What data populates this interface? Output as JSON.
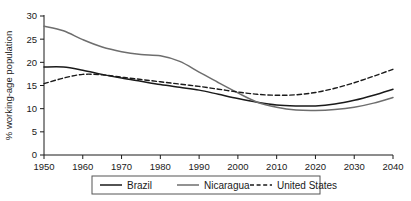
{
  "chart_data": {
    "type": "line",
    "title": "",
    "xlabel": "",
    "ylabel": "% working-age population",
    "xlim": [
      1950,
      2040
    ],
    "ylim": [
      0,
      30
    ],
    "xticks": [
      1950,
      1960,
      1970,
      1980,
      1990,
      2000,
      2010,
      2020,
      2030,
      2040
    ],
    "yticks": [
      0,
      5,
      10,
      15,
      20,
      25,
      30
    ],
    "grid": false,
    "legend_position": "bottom",
    "x": [
      1950,
      1955,
      1960,
      1965,
      1970,
      1975,
      1980,
      1985,
      1990,
      1995,
      2000,
      2005,
      2010,
      2015,
      2020,
      2025,
      2030,
      2035,
      2040
    ],
    "series": [
      {
        "name": "Brazil",
        "style": "solid",
        "color": "#1a1a1a",
        "values": [
          19.0,
          19.0,
          18.3,
          17.4,
          16.6,
          15.9,
          15.2,
          14.6,
          14.0,
          13.1,
          12.2,
          11.4,
          10.8,
          10.6,
          10.6,
          11.0,
          11.8,
          12.9,
          14.2
        ]
      },
      {
        "name": "Nicaragua",
        "style": "solid",
        "color": "#6e6e6e",
        "values": [
          27.8,
          26.8,
          24.9,
          23.3,
          22.3,
          21.7,
          21.4,
          20.2,
          17.9,
          15.6,
          13.4,
          11.4,
          10.3,
          9.7,
          9.6,
          9.8,
          10.3,
          11.2,
          12.4
        ]
      },
      {
        "name": "United States",
        "style": "dashed",
        "color": "#1a1a1a",
        "values": [
          15.4,
          16.6,
          17.4,
          17.3,
          16.8,
          16.3,
          15.8,
          15.3,
          14.8,
          14.2,
          13.6,
          13.1,
          12.9,
          13.0,
          13.5,
          14.4,
          15.6,
          17.0,
          18.5
        ]
      }
    ]
  },
  "legend": {
    "items": [
      {
        "label": "Brazil"
      },
      {
        "label": "Nicaragua"
      },
      {
        "label": "United States"
      }
    ]
  }
}
